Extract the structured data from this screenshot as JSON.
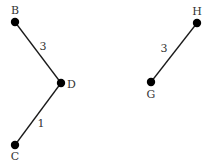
{
  "diagram": {
    "type": "weighted-graph",
    "nodes": [
      {
        "id": "B",
        "label": "B",
        "x": 15,
        "y": 22,
        "label_x": 15,
        "label_y": 14,
        "anchor": "middle"
      },
      {
        "id": "D",
        "label": "D",
        "x": 61,
        "y": 83,
        "label_x": 67,
        "label_y": 88,
        "anchor": "start"
      },
      {
        "id": "C",
        "label": "C",
        "x": 15,
        "y": 145,
        "label_x": 15,
        "label_y": 160,
        "anchor": "middle"
      },
      {
        "id": "H",
        "label": "H",
        "x": 197,
        "y": 23,
        "label_x": 197,
        "label_y": 15,
        "anchor": "middle"
      },
      {
        "id": "G",
        "label": "G",
        "x": 151,
        "y": 82,
        "label_x": 151,
        "label_y": 98,
        "anchor": "middle"
      }
    ],
    "edges": [
      {
        "from": "B",
        "to": "D",
        "weight": "3",
        "label_x": 43,
        "label_y": 50
      },
      {
        "from": "D",
        "to": "C",
        "weight": "1",
        "label_x": 41,
        "label_y": 127
      },
      {
        "from": "G",
        "to": "H",
        "weight": "3",
        "label_x": 164,
        "label_y": 52
      }
    ],
    "colors": {
      "edge": "#1a1a1a",
      "node": "#000000",
      "label": "#333333",
      "background": "#ffffff"
    }
  }
}
